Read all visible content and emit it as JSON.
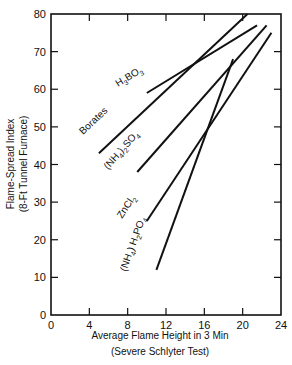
{
  "chart_data": {
    "type": "line",
    "title": "",
    "xlabel": "Average Flame Height in 3 Min",
    "xlabel_sub": "(Severe Schlyter Test)",
    "ylabel": "Flame-Spread Index",
    "ylabel_sub": "(8-Ft Tunnel Furnace)",
    "xlim": [
      0,
      24
    ],
    "ylim": [
      0,
      80
    ],
    "xticks": [
      0,
      4,
      8,
      12,
      16,
      20,
      24
    ],
    "yticks": [
      0,
      10,
      20,
      30,
      40,
      50,
      60,
      70,
      80
    ],
    "grid": false,
    "legend": "inline labels along lines",
    "series": [
      {
        "name": "H3BO3",
        "label_main": "H",
        "label_sub1": "3",
        "label_mid": "BO",
        "label_sub2": "3",
        "x": [
          10,
          21.5
        ],
        "y": [
          59,
          77
        ]
      },
      {
        "name": "Borates",
        "label_main": "Borates",
        "x": [
          5,
          20.5
        ],
        "y": [
          43,
          80
        ]
      },
      {
        "name": "(NH4)2SO4",
        "label_main": "(NH",
        "label_sub1": "4",
        "label_mid": ")",
        "label_sub2": "2",
        "label_end": "SO",
        "label_sub3": "4",
        "x": [
          9,
          22.5
        ],
        "y": [
          38,
          77
        ]
      },
      {
        "name": "ZnCl2",
        "label_main": "ZnCl",
        "label_sub1": "2",
        "x": [
          10,
          23
        ],
        "y": [
          25,
          75
        ]
      },
      {
        "name": "(NH4) H2PO4",
        "label_main": "(NH",
        "label_sub1": "4",
        "label_mid": ") H",
        "label_sub2": "2",
        "label_end": "PO",
        "label_sub3": "4",
        "x": [
          11,
          19
        ],
        "y": [
          12,
          68
        ]
      }
    ]
  }
}
